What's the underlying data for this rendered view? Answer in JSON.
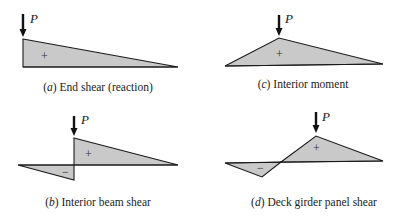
{
  "figure": {
    "fill_color": "#c9c9c9",
    "line_color": "#1a1a1a",
    "load_label": "P",
    "panels": [
      {
        "id": "a",
        "letter": "a",
        "title": "End shear (reaction)",
        "positive_sign": "+",
        "negative_sign": ""
      },
      {
        "id": "b",
        "letter": "b",
        "title": "Interior beam shear",
        "positive_sign": "+",
        "negative_sign": "−"
      },
      {
        "id": "c",
        "letter": "c",
        "title": "Interior moment",
        "positive_sign": "+",
        "negative_sign": ""
      },
      {
        "id": "d",
        "letter": "d",
        "title": "Deck girder panel shear",
        "positive_sign": "+",
        "negative_sign": "−"
      }
    ]
  }
}
